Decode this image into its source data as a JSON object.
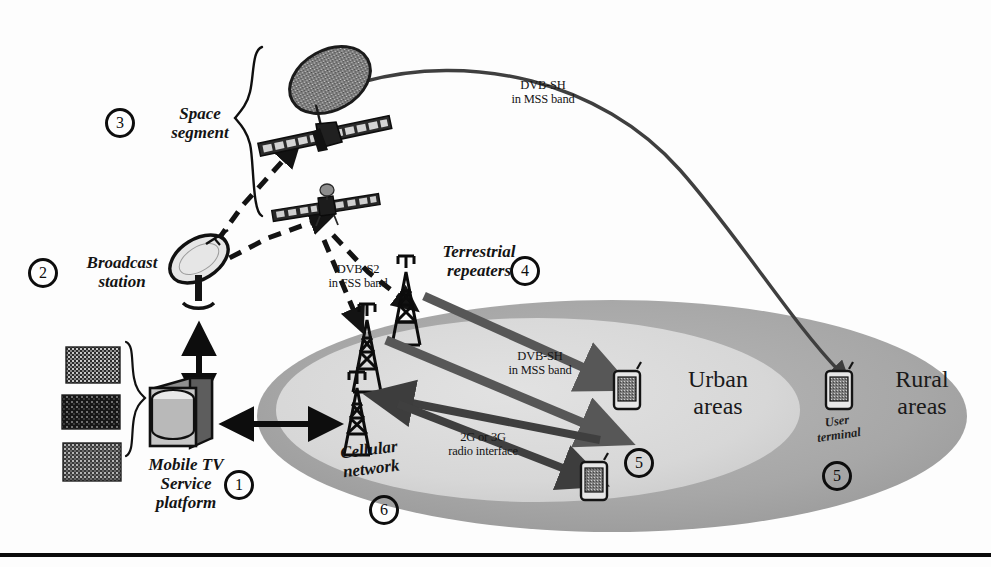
{
  "diagram": {
    "background_color": "#fdfdfd",
    "bottom_rule_color": "#0a0a0a"
  },
  "colors": {
    "ink": "#0d0d0d",
    "urban_ellipse": "#d9d9d9",
    "rural_ellipse": "#a9a9a9",
    "arrow_gray": "#575757",
    "satellite_body": "#2b2b2b",
    "dish_fill": "#9a9a9a"
  },
  "nodes": {
    "platform": {
      "number": "1",
      "label": "Mobile TV\nService\nplatform",
      "icon": "server-database-icon"
    },
    "broadcast_station": {
      "number": "2",
      "label": "Broadcast\nstation",
      "icon": "satellite-dish-icon"
    },
    "space_segment": {
      "number": "3",
      "label": "Space\nsegment",
      "icon": "satellite-icon"
    },
    "terrestrial_repeaters": {
      "number": "4",
      "label": "Terrestrial\nrepeaters",
      "icon": "radio-tower-icon"
    },
    "user_terminal_urban": {
      "number": "5",
      "icon": "mobile-handset-icon"
    },
    "user_terminal_rural": {
      "number": "5",
      "label": "User\nterminal",
      "icon": "mobile-handset-icon"
    },
    "cellular_network": {
      "number": "6",
      "label": "Cellular\nnetwork",
      "icon": "radio-tower-icon"
    }
  },
  "areas": {
    "urban": {
      "label": "Urban\nareas",
      "fill": "#d9d9d9"
    },
    "rural": {
      "label": "Rural\nareas",
      "fill": "#a9a9a9"
    }
  },
  "links": {
    "feeder_uplink": {
      "label": "DVB-S2\nin FSS band",
      "style": "dashed"
    },
    "satellite_downlink": {
      "label": "DVB-SH\nin MSS band",
      "style": "curved-solid"
    },
    "repeater_downlink": {
      "label": "DVB-SH\nin MSS band",
      "style": "solid-arrow"
    },
    "cellular_link": {
      "label": "2G or 3G\nradio interface",
      "style": "double-arrow"
    }
  },
  "content_thumbnails": [
    {
      "name": "tv-content-thumbnail-1"
    },
    {
      "name": "tv-content-thumbnail-2"
    },
    {
      "name": "tv-content-thumbnail-3"
    }
  ]
}
